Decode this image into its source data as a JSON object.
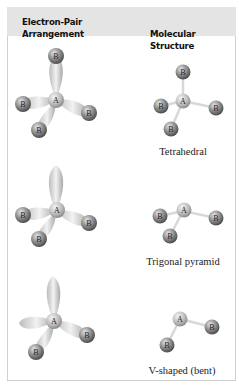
{
  "header": {
    "left_line1": "Electron-Pair",
    "left_line2": "Arrangement",
    "right": "Molecular Structure"
  },
  "atoms": {
    "central": "A",
    "ligand": "B"
  },
  "rows": [
    {
      "arrangement": "tetrahedral",
      "bonding_pairs": 4,
      "lone_pairs": 0,
      "structure_label": "Tetrahedral"
    },
    {
      "arrangement": "tetrahedral",
      "bonding_pairs": 3,
      "lone_pairs": 1,
      "structure_label": "Trigonal pyramid"
    },
    {
      "arrangement": "tetrahedral",
      "bonding_pairs": 2,
      "lone_pairs": 2,
      "structure_label": "V-shaped (bent)"
    }
  ],
  "colors": {
    "header_bg": "#e4e4e4",
    "border": "#cfcfcf",
    "lobe": "#d6d6d6",
    "atom": "#8a8a8a"
  }
}
